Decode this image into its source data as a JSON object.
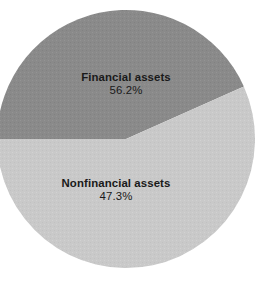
{
  "chart_data": {
    "type": "pie",
    "title": "",
    "categories": [
      "Financial assets",
      "Nonfinancial assets"
    ],
    "values": [
      56.2,
      47.3
    ],
    "labels": [
      "56.2%",
      "47.3%"
    ],
    "unit": "%",
    "legend": "none",
    "grid": false,
    "slices": [
      {
        "name": "Financial assets",
        "value": 56.2,
        "value_label": "56.2%",
        "color": "#8a8a8a",
        "start_angle_deg": 180,
        "end_angle_deg": 336
      },
      {
        "name": "Nonfinancial assets",
        "value": 47.3,
        "value_label": "47.3%",
        "color": "#c9c9c9",
        "start_angle_deg": 336,
        "end_angle_deg": 540
      }
    ]
  },
  "colors": {
    "background": "#ffffff",
    "financial_assets": "#8a8a8a",
    "nonfinancial_assets": "#c9c9c9",
    "text": "#1a1a1a"
  },
  "geometry": {
    "center_x": 126,
    "center_y": 139,
    "radius": 129
  }
}
